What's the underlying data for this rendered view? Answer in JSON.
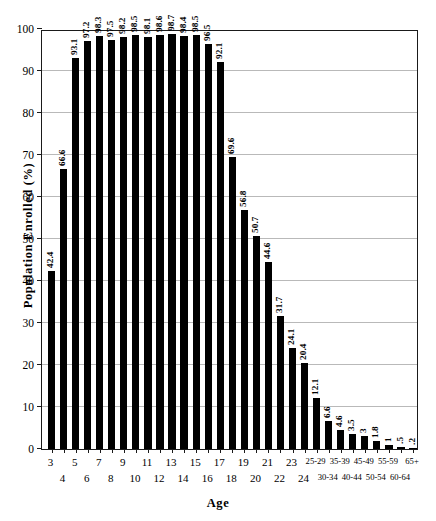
{
  "chart_data": {
    "type": "bar",
    "title": "",
    "xlabel": "Age",
    "ylabel": "Population Enrolled (%)",
    "ylim": [
      0,
      100
    ],
    "ytick_labels": [
      "0",
      "10",
      "20",
      "30",
      "40",
      "50",
      "60",
      "70",
      "80",
      "90",
      "100"
    ],
    "yticks": [
      0,
      10,
      20,
      30,
      40,
      50,
      60,
      70,
      80,
      90,
      100
    ],
    "grid": true,
    "legend": "none",
    "bar_color": "#000000",
    "categories": [
      "3",
      "4",
      "5",
      "6",
      "7",
      "8",
      "9",
      "10",
      "11",
      "12",
      "13",
      "14",
      "15",
      "16",
      "17",
      "18",
      "19",
      "20",
      "21",
      "22",
      "23",
      "24",
      "25-29",
      "30-34",
      "35-39",
      "40-44",
      "45-49",
      "50-54",
      "55-59",
      "60-64",
      "65+"
    ],
    "values": [
      42.4,
      66.6,
      93.1,
      97.2,
      98.3,
      97.5,
      98.2,
      98.5,
      98.1,
      98.6,
      98.7,
      98.4,
      98.5,
      96.5,
      92.1,
      69.6,
      56.8,
      50.7,
      44.6,
      31.7,
      24.1,
      20.4,
      12.1,
      6.6,
      4.6,
      3.5,
      3,
      1.8,
      1,
      0.5,
      0.2
    ],
    "value_labels": [
      "42.4",
      "66.6",
      "93.1",
      "97.2",
      "98.3",
      "97.5",
      "98.2",
      "98.5",
      "98.1",
      "98.6",
      "98.7",
      "98.4",
      "98.5",
      "96.5",
      "92.1",
      "69.6",
      "56.8",
      "50.7",
      "44.6",
      "31.7",
      "24.1",
      "20.4",
      "12.1",
      "6.6",
      "4.6",
      "3.5",
      "3",
      "1.8",
      "1",
      ".5",
      ".2"
    ],
    "xtick_row_top": [
      "3",
      "5",
      "7",
      "9",
      "11",
      "13",
      "15",
      "17",
      "19",
      "21",
      "23",
      "25-29",
      "35-39",
      "45-49",
      "55-59",
      "65+"
    ],
    "xtick_row_bottom": [
      "4",
      "6",
      "8",
      "10",
      "12",
      "14",
      "16",
      "18",
      "20",
      "22",
      "24",
      "30-34",
      "40-44",
      "50-54",
      "60-64"
    ]
  }
}
